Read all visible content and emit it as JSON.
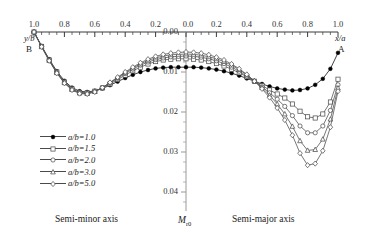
{
  "figure": {
    "top_axis": {
      "left_label": "y/b",
      "left_endpoint": "B",
      "right_label": "x/a",
      "right_endpoint": "A",
      "ticks_left": [
        "1.0",
        "0.8",
        "0.6",
        "0.4",
        "0.2"
      ],
      "center_tick": "0.0",
      "ticks_right": [
        "0.2",
        "0.4",
        "0.6",
        "0.8",
        "1.0"
      ]
    },
    "y_axis": {
      "label": "M",
      "label_sub": "r0",
      "ticks": [
        "0.00",
        "0.01",
        "0.02",
        "0.03",
        "0.04"
      ]
    },
    "footer": {
      "left": "Semi-minor axis",
      "right": "Semi-major axis"
    },
    "legend": [
      {
        "label": "a/b=1.0",
        "marker": "filled-circle"
      },
      {
        "label": "a/b=1.5",
        "marker": "open-square"
      },
      {
        "label": "a/b=2.0",
        "marker": "open-circle"
      },
      {
        "label": "a/b=3.0",
        "marker": "open-triangle"
      },
      {
        "label": "a/b=5.0",
        "marker": "open-diamond"
      }
    ]
  },
  "chart_data": {
    "type": "line",
    "title": "",
    "xlabel": "y/b  (semi-minor axis)  |  x/a  (semi-major axis)",
    "ylabel": "M r0",
    "xlim": [
      -1.0,
      1.0
    ],
    "ylim": [
      0.0,
      0.045
    ],
    "y_inverted": true,
    "grid": false,
    "legend_position": "lower-left",
    "axis_note": "Left half is y/b decreasing 1.0 to 0.0; right half is x/a increasing 0.0 to 1.0. Y axis increases downward.",
    "x": [
      -1.0,
      -0.95,
      -0.9,
      -0.85,
      -0.8,
      -0.75,
      -0.7,
      -0.65,
      -0.6,
      -0.55,
      -0.5,
      -0.45,
      -0.4,
      -0.35,
      -0.3,
      -0.25,
      -0.2,
      -0.15,
      -0.1,
      -0.05,
      0.0,
      0.05,
      0.1,
      0.15,
      0.2,
      0.25,
      0.3,
      0.35,
      0.4,
      0.45,
      0.5,
      0.55,
      0.6,
      0.65,
      0.7,
      0.75,
      0.8,
      0.85,
      0.9,
      0.95,
      1.0
    ],
    "series": [
      {
        "name": "a/b=1.0",
        "marker": "filled-circle",
        "values": [
          0.0,
          0.0035,
          0.0068,
          0.0098,
          0.0122,
          0.0139,
          0.0148,
          0.015,
          0.0147,
          0.0141,
          0.0133,
          0.0124,
          0.0115,
          0.0107,
          0.01,
          0.0095,
          0.0091,
          0.0089,
          0.0088,
          0.0088,
          0.0088,
          0.0088,
          0.0089,
          0.0091,
          0.0094,
          0.0098,
          0.0103,
          0.0109,
          0.0116,
          0.0123,
          0.013,
          0.0136,
          0.0141,
          0.0144,
          0.0146,
          0.0145,
          0.0141,
          0.0132,
          0.0117,
          0.0092,
          0.0052
        ]
      },
      {
        "name": "a/b=1.5",
        "marker": "open-square",
        "values": [
          0.0,
          0.0036,
          0.007,
          0.01,
          0.0125,
          0.0142,
          0.0151,
          0.0152,
          0.0148,
          0.014,
          0.013,
          0.0119,
          0.0108,
          0.0097,
          0.0088,
          0.008,
          0.0074,
          0.007,
          0.0068,
          0.0067,
          0.0067,
          0.0068,
          0.007,
          0.0074,
          0.0079,
          0.0085,
          0.0093,
          0.0102,
          0.0112,
          0.0123,
          0.0134,
          0.0145,
          0.0155,
          0.0165,
          0.018,
          0.0198,
          0.0212,
          0.0215,
          0.0205,
          0.0175,
          0.0118
        ]
      },
      {
        "name": "a/b=2.0",
        "marker": "open-circle",
        "values": [
          0.0,
          0.0036,
          0.007,
          0.0101,
          0.0126,
          0.0143,
          0.0152,
          0.0153,
          0.0148,
          0.0139,
          0.0128,
          0.0116,
          0.0104,
          0.0093,
          0.0083,
          0.0075,
          0.0069,
          0.0065,
          0.0062,
          0.0061,
          0.006,
          0.0061,
          0.0063,
          0.0067,
          0.0072,
          0.0079,
          0.0088,
          0.0098,
          0.011,
          0.0123,
          0.0137,
          0.0152,
          0.0168,
          0.0186,
          0.0209,
          0.0235,
          0.0252,
          0.0252,
          0.0235,
          0.0196,
          0.0132
        ]
      },
      {
        "name": "a/b=3.0",
        "marker": "open-triangle",
        "values": [
          0.0,
          0.0037,
          0.0071,
          0.0102,
          0.0127,
          0.0144,
          0.0153,
          0.0154,
          0.0149,
          0.0139,
          0.0127,
          0.0114,
          0.0102,
          0.009,
          0.008,
          0.0071,
          0.0065,
          0.006,
          0.0057,
          0.0056,
          0.0055,
          0.0056,
          0.0058,
          0.0062,
          0.0067,
          0.0074,
          0.0083,
          0.0094,
          0.0107,
          0.0122,
          0.0139,
          0.0158,
          0.018,
          0.0205,
          0.0236,
          0.0272,
          0.0296,
          0.0294,
          0.0268,
          0.0218,
          0.014
        ]
      },
      {
        "name": "a/b=5.0",
        "marker": "open-diamond",
        "values": [
          0.0,
          0.0037,
          0.0072,
          0.0103,
          0.0128,
          0.0145,
          0.0154,
          0.0155,
          0.015,
          0.0139,
          0.0126,
          0.0113,
          0.01,
          0.0088,
          0.0077,
          0.0068,
          0.0061,
          0.0056,
          0.0053,
          0.0051,
          0.005,
          0.0051,
          0.0053,
          0.0057,
          0.0063,
          0.007,
          0.008,
          0.0092,
          0.0106,
          0.0123,
          0.0142,
          0.0164,
          0.019,
          0.022,
          0.0258,
          0.0303,
          0.0333,
          0.0329,
          0.0297,
          0.0238,
          0.0148
        ]
      }
    ]
  }
}
